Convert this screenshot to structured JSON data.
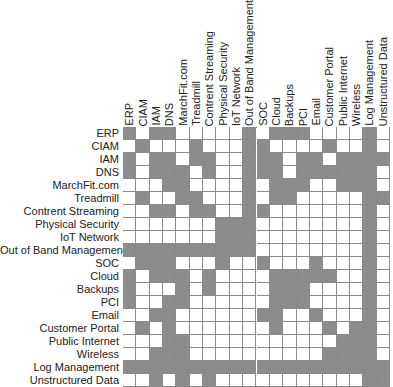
{
  "colors": {
    "filled": "#8c8c8c",
    "empty": "#ffffff",
    "gridline": "#8a8a8a"
  },
  "labels": [
    "ERP",
    "CIAM",
    "IAM",
    "DNS",
    "MarchFit.com",
    "Treadmill",
    "Contrent Streaming",
    "Physical Security",
    "IoT Network",
    "Out of Band Management",
    "SOC",
    "Cloud",
    "Backups",
    "PCI",
    "Email",
    "Customer Portal",
    "Public Internet",
    "Wireless",
    "Log Management",
    "Unstructured Data"
  ],
  "matrix": [
    [
      1,
      0,
      1,
      1,
      0,
      0,
      0,
      0,
      0,
      1,
      0,
      1,
      1,
      1,
      0,
      0,
      0,
      0,
      1,
      0
    ],
    [
      0,
      1,
      0,
      0,
      0,
      1,
      0,
      0,
      0,
      1,
      1,
      0,
      0,
      0,
      0,
      1,
      0,
      0,
      1,
      0
    ],
    [
      1,
      0,
      1,
      1,
      0,
      1,
      1,
      0,
      0,
      1,
      1,
      1,
      0,
      1,
      1,
      0,
      1,
      1,
      1,
      1
    ],
    [
      1,
      0,
      1,
      1,
      1,
      0,
      1,
      0,
      0,
      1,
      1,
      1,
      0,
      1,
      1,
      1,
      1,
      1,
      1,
      0
    ],
    [
      0,
      0,
      0,
      1,
      1,
      0,
      0,
      0,
      0,
      1,
      0,
      1,
      1,
      1,
      0,
      0,
      1,
      1,
      1,
      0
    ],
    [
      0,
      1,
      0,
      0,
      1,
      1,
      0,
      0,
      0,
      1,
      0,
      1,
      1,
      0,
      0,
      0,
      0,
      0,
      1,
      1
    ],
    [
      0,
      0,
      1,
      1,
      0,
      1,
      1,
      0,
      0,
      1,
      1,
      0,
      0,
      0,
      0,
      0,
      0,
      0,
      1,
      0
    ],
    [
      0,
      0,
      0,
      0,
      0,
      0,
      0,
      1,
      1,
      1,
      0,
      0,
      0,
      0,
      0,
      0,
      0,
      0,
      1,
      0
    ],
    [
      0,
      0,
      0,
      0,
      0,
      0,
      0,
      1,
      1,
      1,
      0,
      0,
      0,
      0,
      0,
      0,
      0,
      0,
      1,
      0
    ],
    [
      1,
      1,
      1,
      1,
      1,
      1,
      1,
      1,
      1,
      1,
      0,
      0,
      0,
      0,
      0,
      0,
      0,
      0,
      1,
      0
    ],
    [
      0,
      1,
      1,
      1,
      0,
      0,
      0,
      1,
      0,
      0,
      1,
      0,
      0,
      0,
      1,
      0,
      0,
      0,
      1,
      0
    ],
    [
      1,
      0,
      1,
      1,
      1,
      0,
      1,
      0,
      0,
      0,
      0,
      1,
      1,
      1,
      1,
      1,
      0,
      0,
      1,
      0
    ],
    [
      1,
      0,
      0,
      0,
      1,
      0,
      1,
      0,
      0,
      0,
      0,
      1,
      1,
      1,
      0,
      0,
      0,
      0,
      1,
      0
    ],
    [
      1,
      0,
      0,
      1,
      1,
      0,
      0,
      0,
      0,
      0,
      0,
      1,
      1,
      1,
      0,
      0,
      0,
      0,
      1,
      0
    ],
    [
      0,
      0,
      1,
      1,
      0,
      0,
      0,
      0,
      0,
      0,
      1,
      1,
      0,
      0,
      1,
      0,
      0,
      0,
      1,
      0
    ],
    [
      0,
      1,
      0,
      1,
      0,
      0,
      0,
      0,
      0,
      0,
      0,
      1,
      0,
      0,
      0,
      1,
      0,
      1,
      1,
      0
    ],
    [
      0,
      0,
      0,
      1,
      1,
      0,
      0,
      0,
      0,
      0,
      0,
      0,
      0,
      0,
      0,
      0,
      1,
      1,
      1,
      0
    ],
    [
      0,
      0,
      1,
      1,
      1,
      0,
      0,
      0,
      0,
      0,
      0,
      0,
      0,
      0,
      0,
      1,
      1,
      1,
      1,
      0
    ],
    [
      1,
      1,
      1,
      1,
      1,
      1,
      1,
      1,
      1,
      1,
      1,
      1,
      1,
      1,
      1,
      1,
      1,
      1,
      1,
      1
    ],
    [
      0,
      0,
      1,
      0,
      1,
      0,
      1,
      0,
      0,
      0,
      0,
      0,
      0,
      0,
      0,
      0,
      0,
      0,
      1,
      1
    ]
  ]
}
